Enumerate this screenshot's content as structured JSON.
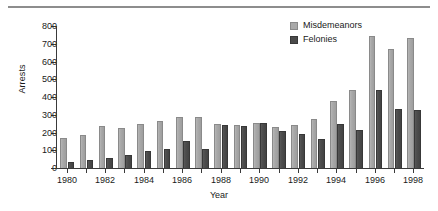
{
  "chart_data": {
    "type": "bar",
    "title": "",
    "xlabel": "Year",
    "ylabel": "Arrests",
    "ylim": [
      0,
      800
    ],
    "yticks": [
      0,
      100,
      200,
      300,
      400,
      500,
      600,
      700,
      800
    ],
    "ytick_labels": [
      "0",
      "100",
      "200",
      "300",
      "400",
      "500",
      "600",
      "700",
      "800"
    ],
    "grid": false,
    "legend_position": "top-right",
    "categories": [
      "1980",
      "1981",
      "1982",
      "1983",
      "1984",
      "1985",
      "1986",
      "1987",
      "1988",
      "1989",
      "1990",
      "1991",
      "1992",
      "1993",
      "1994",
      "1995",
      "1996",
      "1997",
      "1998"
    ],
    "xtick_labels": [
      "1980",
      "1982",
      "1984",
      "1986",
      "1988",
      "1990",
      "1992",
      "1994",
      "1996",
      "1998"
    ],
    "series": [
      {
        "name": "Misdemeanors",
        "color": "#a9a9a9",
        "values": [
          170,
          185,
          235,
          225,
          250,
          265,
          290,
          285,
          250,
          240,
          255,
          230,
          240,
          275,
          380,
          440,
          745,
          670,
          730
        ]
      },
      {
        "name": "Felonies",
        "color": "#4a4a4a",
        "values": [
          35,
          45,
          55,
          75,
          95,
          105,
          150,
          105,
          240,
          235,
          255,
          210,
          190,
          165,
          250,
          215,
          440,
          330,
          325
        ]
      }
    ]
  },
  "legend": {
    "items": [
      {
        "label": "Misdemeanors",
        "color": "#a9a9a9"
      },
      {
        "label": "Felonies",
        "color": "#4a4a4a"
      }
    ]
  }
}
